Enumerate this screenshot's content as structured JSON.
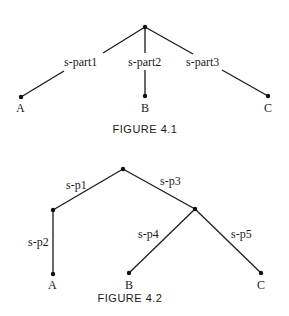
{
  "figures": [
    {
      "caption": "FIGURE 4.1",
      "root": "root",
      "edges": [
        {
          "from": "root",
          "to": "A",
          "label": "s-part1"
        },
        {
          "from": "root",
          "to": "B",
          "label": "s-part2"
        },
        {
          "from": "root",
          "to": "C",
          "label": "s-part3"
        }
      ],
      "leaves": [
        "A",
        "B",
        "C"
      ]
    },
    {
      "caption": "FIGURE 4.2",
      "root": "root",
      "edges": [
        {
          "from": "root",
          "to": "n1",
          "label": "s-p1"
        },
        {
          "from": "n1",
          "to": "A",
          "label": "s-p2"
        },
        {
          "from": "root",
          "to": "n2",
          "label": "s-p3"
        },
        {
          "from": "n2",
          "to": "B",
          "label": "s-p4"
        },
        {
          "from": "n2",
          "to": "C",
          "label": "s-p5"
        }
      ],
      "leaves": [
        "A",
        "B",
        "C"
      ]
    }
  ]
}
